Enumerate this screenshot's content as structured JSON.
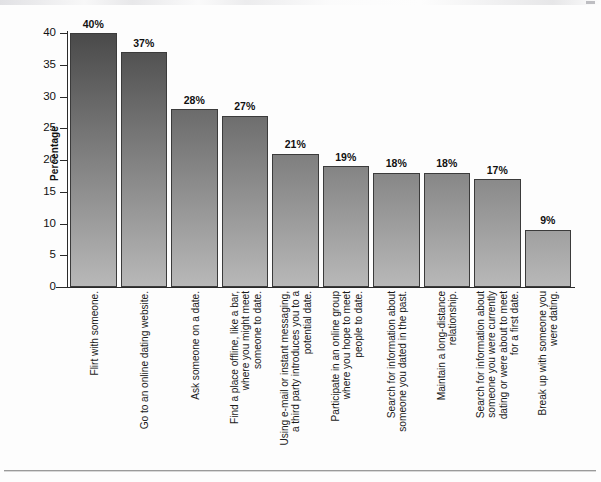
{
  "chart_data": {
    "type": "bar",
    "title": "",
    "subtitle": "",
    "xlabel": "",
    "ylabel": "Percentage",
    "ylim": [
      0,
      40
    ],
    "yticks": [
      0,
      5,
      10,
      15,
      20,
      25,
      30,
      35,
      40
    ],
    "grid": false,
    "legend": null,
    "value_suffix": "%",
    "categories": [
      "Flirt with someone.",
      "Go to an online dating website.",
      "Ask someone on a date.",
      "Find a place offline, like a bar,\nwhere you might meet\nsomeone to date.",
      "Using e-mail or instant messaging,\na third party introduces you to a\npotential date.",
      "Participate in an online group\nwhere you hope to meet\npeople to date.",
      "Search for information about\nsomeone you dated in the past.",
      "Maintain a long-distance\nrelationship.",
      "Search for information about\nsomeone you were currently\ndating or were about to meet\nfor a first date.",
      "Break up with someone you\nwere dating."
    ],
    "values": [
      40,
      37,
      28,
      27,
      21,
      19,
      18,
      18,
      17,
      9
    ],
    "value_labels": [
      "40%",
      "37%",
      "28%",
      "27%",
      "21%",
      "19%",
      "18%",
      "18%",
      "17%",
      "9%"
    ],
    "bar_color_top": "#4a4a4a",
    "bar_color_bottom": "#b9b9b9",
    "bar_border_color": "#3b3b3b",
    "axis_color": "#2a2a2a"
  }
}
